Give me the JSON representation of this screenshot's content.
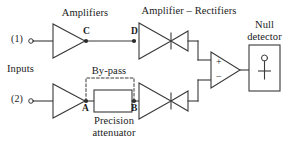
{
  "figure": {
    "title_top_left": "Amplifiers",
    "title_top_right": "Amplifier – Rectifiers",
    "inputs_label": "Inputs",
    "bypass_label": "By-pass",
    "attenuator_label_line1": "Precision",
    "attenuator_label_line2": "attenuator",
    "null_detector_line1": "Null",
    "null_detector_line2": "detector",
    "background_color": "#ffffff",
    "line_color": "#3a3a3a"
  },
  "ports": [
    {
      "id": "in1",
      "label": "(1)"
    },
    {
      "id": "in2",
      "label": "(2)"
    }
  ],
  "nodes": [
    {
      "id": "C",
      "label": "C"
    },
    {
      "id": "D",
      "label": "D"
    },
    {
      "id": "A",
      "label": "A"
    },
    {
      "id": "B",
      "label": "B"
    }
  ],
  "summing_amp": {
    "plus": "+",
    "minus": "−"
  },
  "blocks": [
    {
      "id": "amplifier-top",
      "kind": "triangle-amplifier"
    },
    {
      "id": "amplifier-bottom",
      "kind": "triangle-amplifier"
    },
    {
      "id": "amp-rectifier-top",
      "kind": "triangle-amplifier-with-diode"
    },
    {
      "id": "amp-rectifier-bottom",
      "kind": "triangle-amplifier-with-diode"
    },
    {
      "id": "precision-attenuator",
      "kind": "rectangle"
    },
    {
      "id": "bypass-path",
      "kind": "dashed-path"
    },
    {
      "id": "differential-amplifier",
      "kind": "triangle-amplifier"
    },
    {
      "id": "null-detector",
      "kind": "meter-box"
    }
  ]
}
